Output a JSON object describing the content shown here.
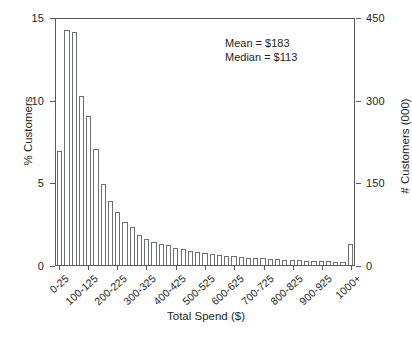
{
  "chart_data": {
    "type": "bar",
    "title": "",
    "subtitle": "",
    "xlabel": "Total Spend ($)",
    "ylabel": "% Customers",
    "ylabel_right": "# Customers (000)",
    "ylim": [
      0,
      15
    ],
    "ylim_right": [
      0,
      450
    ],
    "yticks": [
      "0",
      "5",
      "10",
      "15"
    ],
    "ytick_values": [
      0,
      5,
      10,
      15
    ],
    "yticks_right": [
      "0",
      "150",
      "300",
      "450"
    ],
    "ytick_values_right": [
      0,
      150,
      300,
      450
    ],
    "grid": false,
    "legend": "none",
    "bar_style": {
      "fill": "#ffffff",
      "edge": "#6d6e71",
      "axis_color": "#58595b",
      "text_color": "#231f20"
    },
    "annotations": [
      "Mean = $183",
      "Median = $113"
    ],
    "categories": [
      "0-25",
      "25-50",
      "50-75",
      "75-100",
      "100-125",
      "125-150",
      "150-175",
      "175-200",
      "200-225",
      "225-250",
      "250-275",
      "275-300",
      "300-325",
      "325-350",
      "350-375",
      "375-400",
      "400-425",
      "425-450",
      "450-475",
      "475-500",
      "500-525",
      "525-550",
      "550-575",
      "575-600",
      "600-625",
      "625-650",
      "650-675",
      "675-700",
      "700-725",
      "725-750",
      "750-775",
      "775-800",
      "800-825",
      "825-850",
      "850-875",
      "875-900",
      "900-925",
      "925-950",
      "950-975",
      "975-1000",
      "1000+"
    ],
    "values": [
      6.9,
      14.2,
      14.1,
      10.2,
      9.0,
      7.0,
      4.9,
      3.9,
      3.2,
      2.6,
      2.3,
      1.8,
      1.6,
      1.4,
      1.3,
      1.2,
      1.05,
      0.95,
      0.85,
      0.8,
      0.72,
      0.66,
      0.6,
      0.56,
      0.52,
      0.48,
      0.45,
      0.42,
      0.4,
      0.38,
      0.35,
      0.33,
      0.31,
      0.29,
      0.27,
      0.25,
      0.24,
      0.22,
      0.21,
      0.2,
      1.3
    ],
    "xtick_labels": [
      "0-25",
      "100-125",
      "200-225",
      "300-325",
      "400-425",
      "500-525",
      "600-625",
      "700-725",
      "800-825",
      "900-925",
      "1000+"
    ],
    "xtick_indices": [
      0,
      4,
      8,
      12,
      16,
      20,
      24,
      28,
      32,
      36,
      40
    ]
  }
}
